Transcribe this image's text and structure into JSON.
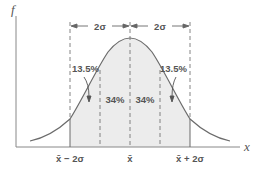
{
  "diagram": {
    "y_axis_label": "f",
    "x_axis_label": "x",
    "dimension_labels": {
      "left": "2σ",
      "right": "2σ"
    },
    "region_labels": {
      "outer_left": "13.5%",
      "inner_left": "34%",
      "inner_right": "34%",
      "outer_right": "13.5%"
    },
    "tick_labels": {
      "left": "x̄ − 2σ",
      "center": "x̄",
      "right": "x̄ + 2σ"
    },
    "colors": {
      "line": "#6b6b6b",
      "shade": "#ececec",
      "text": "#555555"
    }
  }
}
